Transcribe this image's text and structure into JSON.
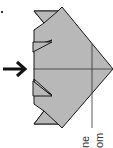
{
  "diagram": {
    "type": "origami-fold-step",
    "orientation": "rotated-90",
    "fill_color": "#b8b8b8",
    "stroke_color": "#1a1a1a",
    "arrow": {
      "icon": "arrow-right-icon",
      "color": "#111111"
    },
    "labels": [
      "ne",
      "om"
    ]
  }
}
